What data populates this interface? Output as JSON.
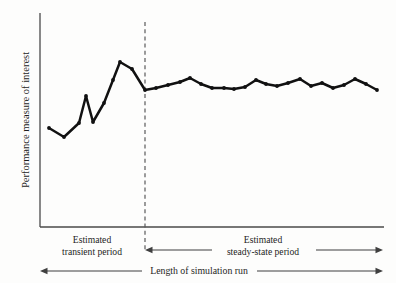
{
  "figure": {
    "background_color": "#fdfdfc",
    "line_color": "#111111",
    "axis_color": "#4a4a4a",
    "annotation_color": "#3f3f3f"
  },
  "axes": {
    "ylabel": "Performance measure of interest",
    "xlabel": "",
    "x_axis_y_px": 227,
    "y_axis_x_px": 40,
    "y_axis_top_px": 13,
    "x_axis_right_px": 384
  },
  "annotations": {
    "divider_label": "",
    "divider_x_px": 145,
    "transient": {
      "line1": "Estimated",
      "line2": "transient period"
    },
    "steady_state": {
      "line1": "Estimated",
      "line2": "steady-state period"
    },
    "total_span": {
      "label": "Length of simulation run"
    }
  },
  "chart_data": {
    "type": "line",
    "title": "",
    "xlabel": "Length of simulation run",
    "ylabel": "Performance measure of interest",
    "grid": false,
    "legend_position": "none",
    "xlim": [
      0,
      30
    ],
    "ylim": [
      0,
      1
    ],
    "annotations": [
      "Estimated transient period",
      "Estimated steady-state period",
      "Length of simulation run"
    ],
    "series": [
      {
        "name": "Performance measure",
        "x_px": [
          49,
          64,
          79,
          86,
          93,
          104,
          113,
          120,
          132,
          145,
          156,
          168,
          180,
          190,
          201,
          212,
          224,
          234,
          245,
          256,
          266,
          277,
          288,
          300,
          311,
          322,
          333,
          344,
          355,
          366,
          377
        ],
        "y_px": [
          128,
          137,
          123,
          96,
          122,
          103,
          80,
          62,
          69,
          90,
          88,
          85,
          82,
          78,
          84,
          88,
          88,
          89,
          87,
          80,
          84,
          86,
          83,
          79,
          86,
          83,
          88,
          85,
          79,
          84,
          90
        ],
        "points": [
          {
            "x": 0,
            "y": 0.462
          },
          {
            "x": 1,
            "y": 0.421
          },
          {
            "x": 2,
            "y": 0.486
          },
          {
            "x": 3,
            "y": 0.612
          },
          {
            "x": 4,
            "y": 0.491
          },
          {
            "x": 5,
            "y": 0.579
          },
          {
            "x": 6,
            "y": 0.687
          },
          {
            "x": 7,
            "y": 0.771
          },
          {
            "x": 8,
            "y": 0.738
          },
          {
            "x": 9,
            "y": 0.64
          },
          {
            "x": 10,
            "y": 0.65
          },
          {
            "x": 11,
            "y": 0.664
          },
          {
            "x": 12,
            "y": 0.678
          },
          {
            "x": 13,
            "y": 0.696
          },
          {
            "x": 14,
            "y": 0.668
          },
          {
            "x": 15,
            "y": 0.65
          },
          {
            "x": 16,
            "y": 0.65
          },
          {
            "x": 17,
            "y": 0.645
          },
          {
            "x": 18,
            "y": 0.654
          },
          {
            "x": 19,
            "y": 0.687
          },
          {
            "x": 20,
            "y": 0.668
          },
          {
            "x": 21,
            "y": 0.659
          },
          {
            "x": 22,
            "y": 0.673
          },
          {
            "x": 23,
            "y": 0.692
          },
          {
            "x": 24,
            "y": 0.659
          },
          {
            "x": 25,
            "y": 0.673
          },
          {
            "x": 26,
            "y": 0.65
          },
          {
            "x": 27,
            "y": 0.664
          },
          {
            "x": 28,
            "y": 0.692
          },
          {
            "x": 29,
            "y": 0.668
          },
          {
            "x": 30,
            "y": 0.64
          }
        ]
      }
    ]
  }
}
